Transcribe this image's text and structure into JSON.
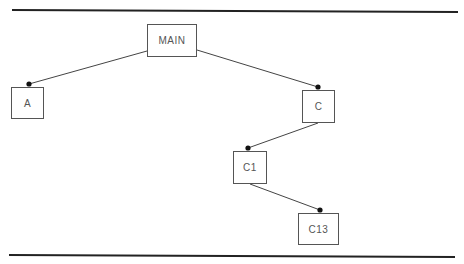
{
  "diagram": {
    "type": "tree",
    "colors": {
      "rule": "#222222",
      "edge": "#444444",
      "node_border": "#555555",
      "node_text": "#555555",
      "connector_dot": "#111111"
    },
    "rules": [
      {
        "name": "top-rule",
        "x1": 12,
        "y1": 10,
        "x2": 458,
        "y2": 12
      },
      {
        "name": "bottom-rule",
        "x1": 9,
        "y1": 255,
        "x2": 455,
        "y2": 257
      }
    ],
    "nodes": [
      {
        "id": "MAIN",
        "label": "MAIN",
        "x": 147,
        "y": 24,
        "w": 50,
        "h": 33
      },
      {
        "id": "A",
        "label": "A",
        "x": 11,
        "y": 87,
        "w": 33,
        "h": 32
      },
      {
        "id": "C",
        "label": "C",
        "x": 302,
        "y": 90,
        "w": 33,
        "h": 33
      },
      {
        "id": "C1",
        "label": "C1",
        "x": 233,
        "y": 151,
        "w": 34,
        "h": 33
      },
      {
        "id": "C13",
        "label": "C13",
        "x": 298,
        "y": 213,
        "w": 41,
        "h": 32
      }
    ],
    "edges": [
      {
        "from": "MAIN",
        "to": "A",
        "x1": 147,
        "y1": 51,
        "x2": 29,
        "y2": 84
      },
      {
        "from": "MAIN",
        "to": "C",
        "x1": 197,
        "y1": 50,
        "x2": 318,
        "y2": 87
      },
      {
        "from": "C",
        "to": "C1",
        "x1": 318,
        "y1": 123,
        "x2": 248,
        "y2": 148
      },
      {
        "from": "C1",
        "to": "C13",
        "x1": 250,
        "y1": 184,
        "x2": 320,
        "y2": 210
      }
    ]
  }
}
